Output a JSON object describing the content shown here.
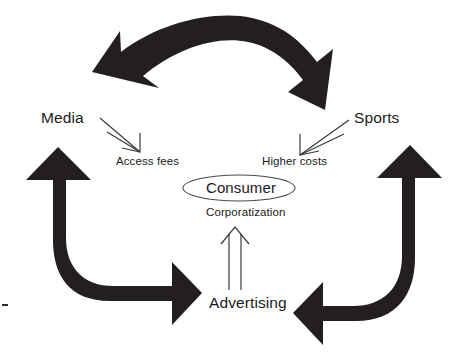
{
  "diagram": {
    "type": "cycle-diagram",
    "background_color": "#ffffff",
    "arrow_color": "#231f20",
    "text_color": "#1a1a1a",
    "nodes": [
      {
        "id": "media",
        "label": "Media",
        "position": "upper-left"
      },
      {
        "id": "sports",
        "label": "Sports",
        "position": "upper-right"
      },
      {
        "id": "advertising",
        "label": "Advertising",
        "position": "bottom-center"
      }
    ],
    "center": {
      "label": "Consumer",
      "shape": "ellipse",
      "sublabel": "Corporatization"
    },
    "flows": [
      {
        "id": "access-fees",
        "label": "Access fees",
        "from": "media",
        "to": "consumer",
        "direction": "down-right"
      },
      {
        "id": "higher-costs",
        "label": "Higher costs",
        "from": "sports",
        "to": "consumer",
        "direction": "down-left"
      },
      {
        "id": "corporatization",
        "label": "Corporatization",
        "from": "advertising",
        "to": "consumer",
        "direction": "up"
      }
    ],
    "cycle_arrows": [
      {
        "id": "top-arrow",
        "shape": "curved-double-headed",
        "orientation": "horizontal-arc",
        "connects": [
          "media",
          "sports"
        ]
      },
      {
        "id": "left-arrow",
        "shape": "j-curve-double-headed",
        "orientation": "vertical-to-horizontal",
        "connects": [
          "media",
          "advertising"
        ]
      },
      {
        "id": "right-arrow",
        "shape": "mirrored-j-curve-double-headed",
        "orientation": "vertical-to-horizontal",
        "connects": [
          "sports",
          "advertising"
        ]
      }
    ]
  }
}
